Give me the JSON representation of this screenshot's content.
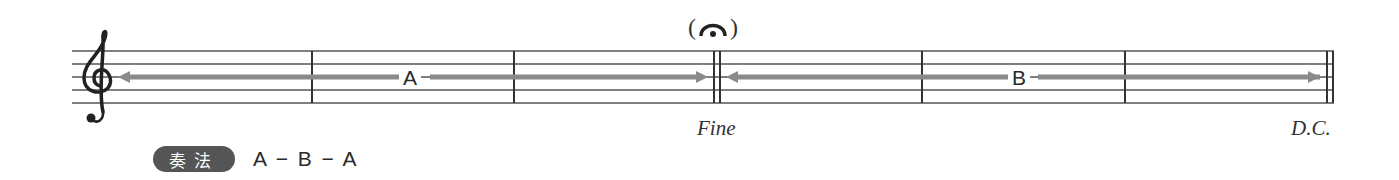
{
  "score": {
    "clef": "treble-clef",
    "sections": [
      {
        "label": "A",
        "measures": 3,
        "arrow": "double-headed"
      },
      {
        "label": "B",
        "measures": 3,
        "arrow": "double-headed"
      }
    ],
    "fermata": {
      "paren_open": "(",
      "paren_close": ")"
    },
    "fine_label": "Fine",
    "dc_label": "D.C."
  },
  "legend": {
    "badge_label": "奏法",
    "form_text": "A − B − A"
  },
  "colors": {
    "staff_line": "#555555",
    "arrow": "#8a8a8a",
    "badge_bg": "#555555",
    "badge_text": "#ffffff"
  }
}
